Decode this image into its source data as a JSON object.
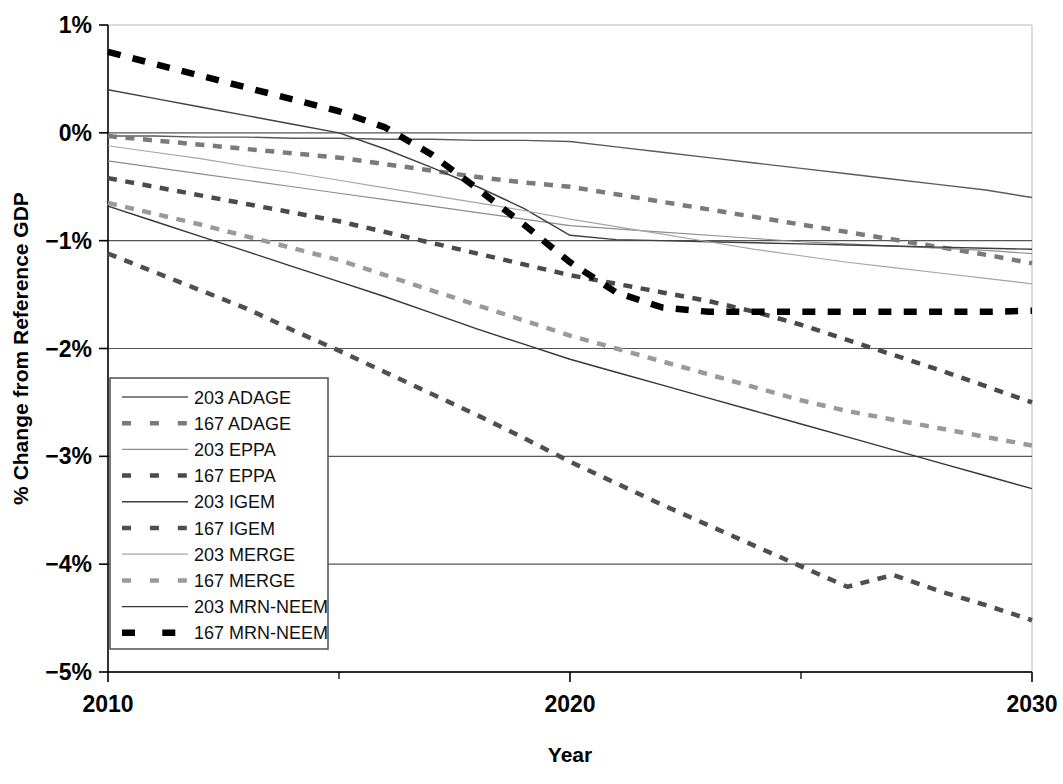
{
  "chart_data": {
    "type": "line",
    "title": "",
    "xlabel": "Year",
    "ylabel": "% Change from Reference GDP",
    "xlim": [
      2010,
      2030
    ],
    "ylim": [
      -5,
      1
    ],
    "xticks": [
      2010,
      2020,
      2030
    ],
    "xtick_labels": [
      "2010",
      "2020",
      "2030"
    ],
    "xminor_ticks": [
      2015,
      2025
    ],
    "yticks": [
      1,
      0,
      -1,
      -2,
      -3,
      -4,
      -5
    ],
    "ytick_labels": [
      "1%",
      "0%",
      "−1%",
      "−2%",
      "−3%",
      "−4%",
      "−5%"
    ],
    "grid": true,
    "grid_axis": "y",
    "legend_position": "lower-left-inside",
    "x": [
      2010,
      2011,
      2012,
      2013,
      2014,
      2015,
      2016,
      2017,
      2018,
      2019,
      2020,
      2021,
      2022,
      2023,
      2024,
      2025,
      2026,
      2027,
      2028,
      2029,
      2030
    ],
    "series": [
      {
        "name": "203 ADAGE",
        "style": "solid",
        "color": "#5a5a5a",
        "width": 1.4,
        "values": [
          -0.03,
          -0.03,
          -0.04,
          -0.04,
          -0.05,
          -0.05,
          -0.06,
          -0.06,
          -0.07,
          -0.07,
          -0.08,
          -0.13,
          -0.18,
          -0.23,
          -0.28,
          -0.33,
          -0.38,
          -0.43,
          -0.48,
          -0.53,
          -0.6
        ]
      },
      {
        "name": "167 ADAGE",
        "style": "dashed",
        "color": "#7a7a7a",
        "width": 4.5,
        "values": [
          -0.03,
          -0.07,
          -0.11,
          -0.15,
          -0.19,
          -0.23,
          -0.29,
          -0.35,
          -0.41,
          -0.46,
          -0.5,
          -0.57,
          -0.64,
          -0.71,
          -0.78,
          -0.85,
          -0.92,
          -0.99,
          -1.06,
          -1.13,
          -1.21
        ]
      },
      {
        "name": "203 EPPA",
        "style": "solid",
        "color": "#8c8c8c",
        "width": 1.2,
        "values": [
          -0.26,
          -0.32,
          -0.38,
          -0.44,
          -0.5,
          -0.56,
          -0.62,
          -0.68,
          -0.74,
          -0.8,
          -0.86,
          -0.89,
          -0.92,
          -0.95,
          -0.98,
          -1.01,
          -1.03,
          -1.05,
          -1.07,
          -1.09,
          -1.12
        ]
      },
      {
        "name": "167 EPPA",
        "style": "dashed",
        "color": "#4a4a4a",
        "width": 4.5,
        "values": [
          -0.42,
          -0.5,
          -0.58,
          -0.66,
          -0.74,
          -0.82,
          -0.92,
          -1.02,
          -1.12,
          -1.22,
          -1.32,
          -1.4,
          -1.48,
          -1.56,
          -1.66,
          -1.78,
          -1.92,
          -2.06,
          -2.2,
          -2.35,
          -2.5
        ]
      },
      {
        "name": "203 IGEM",
        "style": "solid",
        "color": "#3f3f3f",
        "width": 1.4,
        "values": [
          0.4,
          0.32,
          0.24,
          0.16,
          0.08,
          0.0,
          -0.15,
          -0.32,
          -0.5,
          -0.7,
          -0.95,
          -0.99,
          -1.0,
          -1.01,
          -1.02,
          -1.03,
          -1.04,
          -1.05,
          -1.06,
          -1.07,
          -1.08
        ]
      },
      {
        "name": "167 IGEM",
        "style": "dashed",
        "color": "#4f4f4f",
        "width": 4.5,
        "values": [
          -1.12,
          -1.29,
          -1.46,
          -1.63,
          -1.83,
          -2.02,
          -2.22,
          -2.42,
          -2.62,
          -2.83,
          -3.05,
          -3.25,
          -3.45,
          -3.64,
          -3.83,
          -4.02,
          -4.21,
          -4.1,
          -4.25,
          -4.38,
          -4.52
        ]
      },
      {
        "name": "203 MERGE",
        "style": "solid",
        "color": "#a5a5a5",
        "width": 1.2,
        "values": [
          -0.12,
          -0.18,
          -0.24,
          -0.31,
          -0.37,
          -0.44,
          -0.51,
          -0.58,
          -0.65,
          -0.72,
          -0.8,
          -0.87,
          -0.94,
          -1.01,
          -1.08,
          -1.14,
          -1.2,
          -1.25,
          -1.3,
          -1.35,
          -1.4
        ]
      },
      {
        "name": "167 MERGE",
        "style": "dashed",
        "color": "#9a9a9a",
        "width": 4.5,
        "values": [
          -0.65,
          -0.75,
          -0.85,
          -0.96,
          -1.07,
          -1.18,
          -1.32,
          -1.46,
          -1.6,
          -1.74,
          -1.88,
          -2.0,
          -2.12,
          -2.24,
          -2.36,
          -2.48,
          -2.58,
          -2.66,
          -2.74,
          -2.82,
          -2.9
        ]
      },
      {
        "name": "203 MRN-NEEM",
        "style": "solid",
        "color": "#353535",
        "width": 1.4,
        "values": [
          -0.68,
          -0.82,
          -0.96,
          -1.1,
          -1.24,
          -1.38,
          -1.52,
          -1.67,
          -1.82,
          -1.96,
          -2.1,
          -2.22,
          -2.34,
          -2.46,
          -2.58,
          -2.7,
          -2.82,
          -2.94,
          -3.06,
          -3.18,
          -3.3
        ]
      },
      {
        "name": "167 MRN-NEEM",
        "style": "dashed",
        "color": "#000000",
        "width": 6.5,
        "values": [
          0.75,
          0.64,
          0.53,
          0.42,
          0.31,
          0.2,
          0.05,
          -0.2,
          -0.52,
          -0.85,
          -1.2,
          -1.48,
          -1.62,
          -1.66,
          -1.66,
          -1.66,
          -1.66,
          -1.66,
          -1.66,
          -1.66,
          -1.65
        ]
      }
    ]
  },
  "legend": {
    "items": [
      {
        "label": "203 ADAGE"
      },
      {
        "label": "167 ADAGE"
      },
      {
        "label": "203 EPPA"
      },
      {
        "label": "167 EPPA"
      },
      {
        "label": "203 IGEM"
      },
      {
        "label": "167 IGEM"
      },
      {
        "label": "203 MERGE"
      },
      {
        "label": "167 MERGE"
      },
      {
        "label": "203 MRN-NEEM"
      },
      {
        "label": "167 MRN-NEEM"
      }
    ]
  },
  "colors": {
    "background": "#ffffff",
    "axis": "#000000",
    "grid": "#555555",
    "plot_border": "#dcdcdc",
    "legend_border": "#5a5a5a"
  }
}
